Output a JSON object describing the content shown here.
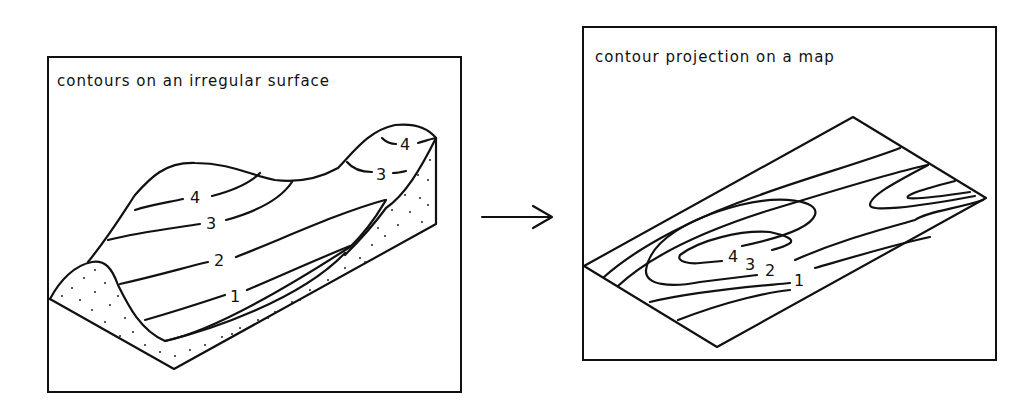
{
  "left_panel": {
    "title": "contours on an irregular surface",
    "contour_labels": [
      {
        "text": "4",
        "x": 190,
        "y": 194
      },
      {
        "text": "3",
        "x": 206,
        "y": 222
      },
      {
        "text": "2",
        "x": 214,
        "y": 260
      },
      {
        "text": "1",
        "x": 230,
        "y": 297
      },
      {
        "text": "4",
        "x": 402,
        "y": 149
      },
      {
        "text": "3",
        "x": 380,
        "y": 181
      }
    ]
  },
  "right_panel": {
    "title": "contour projection on a map",
    "contour_labels": [
      {
        "text": "4",
        "x": 731,
        "y": 262
      },
      {
        "text": "3",
        "x": 747,
        "y": 270
      },
      {
        "text": "2",
        "x": 768,
        "y": 275
      },
      {
        "text": "1",
        "x": 796,
        "y": 285
      }
    ]
  },
  "arrow": {
    "direction": "right",
    "meaning": "projection"
  },
  "colors": {
    "line": "#111111",
    "background": "#ffffff"
  }
}
